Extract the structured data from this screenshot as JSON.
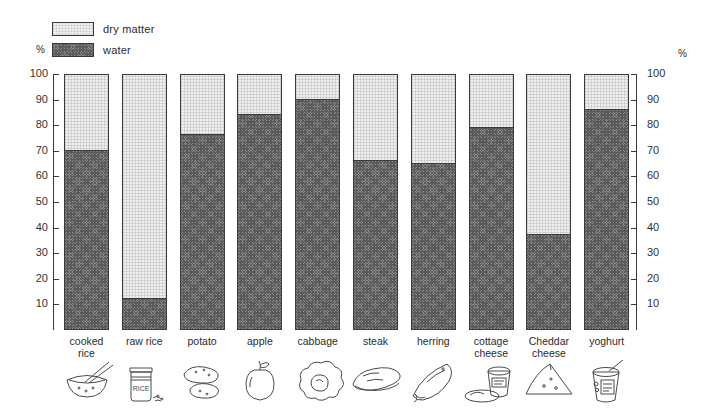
{
  "legend": {
    "dry_matter_label": "dry matter",
    "water_label": "water",
    "percent_symbol": "%"
  },
  "axis": {
    "left_percent_symbol": "%",
    "right_percent_symbol": "%",
    "ticks": [
      "100",
      "90",
      "80",
      "70",
      "60",
      "50",
      "40",
      "30",
      "20",
      "10"
    ]
  },
  "chart_data": {
    "type": "bar",
    "title": "",
    "subtitle": "",
    "xlabel": "",
    "ylabel": "%",
    "ylim": [
      0,
      100
    ],
    "grid": false,
    "stacked": true,
    "legend_position": "top-left",
    "categories": [
      "cooked rice",
      "raw rice",
      "potato",
      "apple",
      "cabbage",
      "steak",
      "herring",
      "cottage cheese",
      "Cheddar cheese",
      "yoghurt"
    ],
    "category_lines": [
      [
        "cooked",
        "rice"
      ],
      [
        "raw rice"
      ],
      [
        "potato"
      ],
      [
        "apple"
      ],
      [
        "cabbage"
      ],
      [
        "steak"
      ],
      [
        "herring"
      ],
      [
        "cottage",
        "cheese"
      ],
      [
        "Cheddar",
        "cheese"
      ],
      [
        "yoghurt"
      ]
    ],
    "series": [
      {
        "name": "water",
        "color": "#8e8e8e",
        "values": [
          70,
          12,
          76,
          84,
          90,
          66,
          65,
          79,
          37,
          86
        ]
      },
      {
        "name": "dry matter",
        "color": "#efefef",
        "values": [
          30,
          88,
          24,
          16,
          10,
          34,
          35,
          21,
          63,
          14
        ]
      }
    ],
    "axis_ticks": [
      0,
      10,
      20,
      30,
      40,
      50,
      60,
      70,
      80,
      90,
      100
    ],
    "tick_labels_shown": [
      "10",
      "20",
      "30",
      "40",
      "50",
      "60",
      "70",
      "80",
      "90",
      "100"
    ]
  },
  "icons": [
    {
      "name": "rice-bowl-icon",
      "label": "cooked rice"
    },
    {
      "name": "rice-jar-icon",
      "label": "raw rice",
      "jar_text": "RICE"
    },
    {
      "name": "potatoes-icon",
      "label": "potato"
    },
    {
      "name": "apple-icon",
      "label": "apple"
    },
    {
      "name": "cabbage-icon",
      "label": "cabbage"
    },
    {
      "name": "steak-icon",
      "label": "steak"
    },
    {
      "name": "fish-icon",
      "label": "herring"
    },
    {
      "name": "cottage-cheese-tub-icon",
      "label": "cottage cheese"
    },
    {
      "name": "cheese-wedge-icon",
      "label": "Cheddar cheese"
    },
    {
      "name": "yoghurt-pot-icon",
      "label": "yoghurt"
    }
  ]
}
